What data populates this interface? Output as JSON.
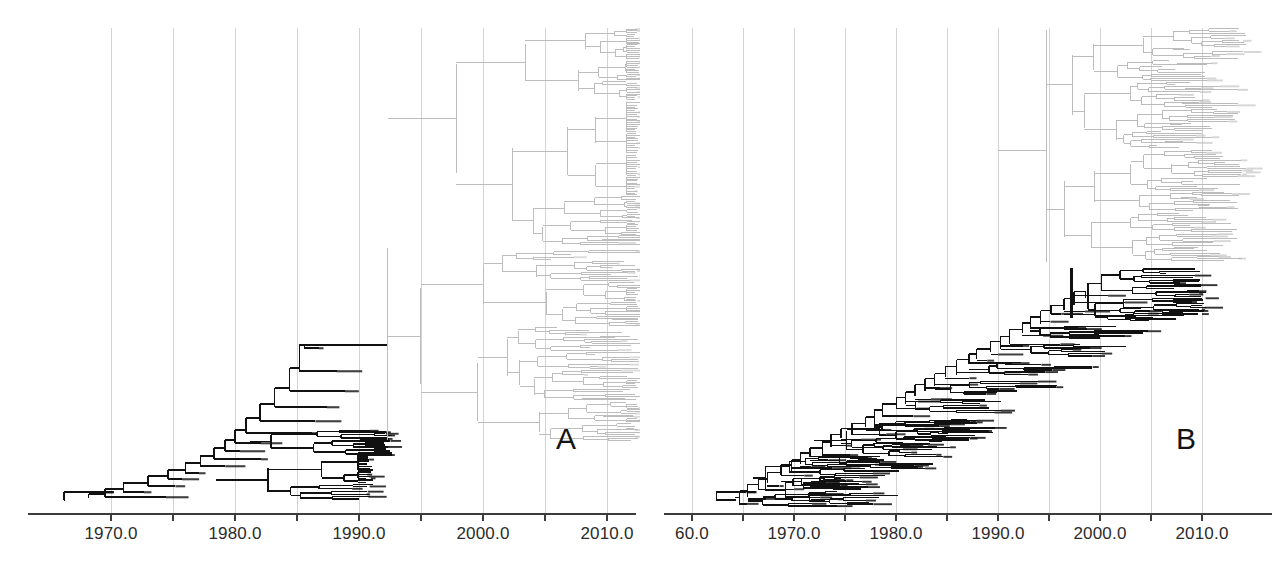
{
  "figure": {
    "kind": "phylogenetic-time-tree-figure",
    "background": "#ffffff",
    "width": 1276,
    "height": 583
  },
  "panels": [
    {
      "id": "A",
      "letter": "A",
      "letter_x": 556,
      "letter_y": 424,
      "left": 0,
      "width": 640,
      "plot": {
        "x_left": 28,
        "x_right": 636,
        "baseline_y": 514,
        "grid_top": 28,
        "px_per_year": 12.4,
        "year_at_x": {
          "year": 1970,
          "x": 111
        }
      },
      "axis": {
        "ticks": [
          1970,
          1975,
          1980,
          1985,
          1990,
          1995,
          2000,
          2005,
          2010
        ],
        "labeled": [
          1970,
          1980,
          1990,
          2000,
          2010
        ],
        "labels": [
          "1970.0",
          "1980.0",
          "1990.0",
          "2000.0",
          "2010.0"
        ],
        "label_y": 524,
        "tick_length": 7,
        "axis_color": "#3c3c3c",
        "grid_color": "#c8c8c8"
      },
      "tree": {
        "root_year": 1966.2,
        "root_y": 500,
        "dark_color": "#111111",
        "light_color": "#bdbdbd",
        "dark_width": 1.5,
        "light_width": 1.0,
        "clades": [
          {
            "name": "backbone-dark",
            "color": "dark"
          },
          {
            "name": "upper-light-clade",
            "color": "light"
          },
          {
            "name": "lower-light-clade",
            "color": "light"
          }
        ]
      }
    },
    {
      "id": "B",
      "letter": "B",
      "letter_x": 1176,
      "letter_y": 424,
      "left": 640,
      "width": 636,
      "plot": {
        "x_left": 664,
        "x_right": 1272,
        "baseline_y": 514,
        "grid_top": 28,
        "px_per_year": 10.2,
        "year_at_x": {
          "year": 1970,
          "x": 794
        }
      },
      "axis": {
        "ticks": [
          1960,
          1965,
          1970,
          1975,
          1980,
          1985,
          1990,
          1995,
          2000,
          2005,
          2010
        ],
        "labeled": [
          1960,
          1970,
          1980,
          1990,
          2000,
          2010
        ],
        "labels": [
          "60.0",
          "1970.0",
          "1980.0",
          "1990.0",
          "2000.0",
          "2010.0"
        ],
        "label_y": 524,
        "tick_length": 7,
        "axis_color": "#3c3c3c",
        "grid_color": "#c8c8c8"
      },
      "tree": {
        "root_year": 1962.4,
        "root_y": 500,
        "dark_color": "#111111",
        "light_color": "#b5b5b5",
        "dark_width": 1.4,
        "light_width": 0.9,
        "clades": [
          {
            "name": "dark-ladder-backbone",
            "color": "dark"
          },
          {
            "name": "upper-light-radiation",
            "color": "light"
          }
        ]
      }
    }
  ],
  "caption": {
    "partial_text": ""
  }
}
